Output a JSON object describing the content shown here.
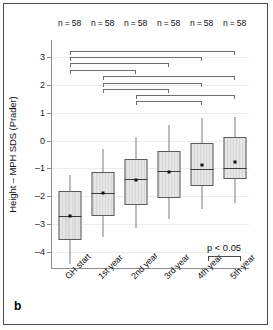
{
  "panel": {
    "letter": "b"
  },
  "chart_data": {
    "type": "box",
    "title": "",
    "xlabel": "",
    "ylabel": "Height – MPH SDS (Prader)",
    "ylim": [
      -4.6,
      3.6
    ],
    "yticks": [
      3,
      2,
      1,
      0,
      -1,
      -2,
      -3,
      -4
    ],
    "ytick_labels": [
      "3",
      "2",
      "1",
      "0",
      "–1",
      "–2",
      "–3",
      "–4"
    ],
    "grid": true,
    "legend": "none",
    "categories": [
      "GH start",
      "1st year",
      "2nd year",
      "3rd year",
      "4th year",
      "5th year"
    ],
    "n_labels": [
      "n = 58",
      "n = 58",
      "n = 58",
      "n = 58",
      "n = 58",
      "n = 58"
    ],
    "boxes": [
      {
        "category": "GH start",
        "whisker_low": -4.43,
        "q1": -3.57,
        "median": -2.7,
        "mean": -2.7,
        "q3": -1.82,
        "whisker_high": -1.23
      },
      {
        "category": "1st year",
        "whisker_low": -3.47,
        "q1": -2.72,
        "median": -1.87,
        "mean": -1.87,
        "q3": -1.11,
        "whisker_high": -0.31
      },
      {
        "category": "2nd year",
        "whisker_low": -3.13,
        "q1": -2.3,
        "median": -1.38,
        "mean": -1.4,
        "q3": -0.65,
        "whisker_high": 0.13
      },
      {
        "category": "3rd year",
        "whisker_low": -2.8,
        "q1": -2.06,
        "median": -1.08,
        "mean": -1.13,
        "q3": -0.36,
        "whisker_high": 0.55
      },
      {
        "category": "4th year",
        "whisker_low": -2.44,
        "q1": -1.63,
        "median": -1.02,
        "mean": -0.88,
        "q3": -0.09,
        "whisker_high": 0.79
      },
      {
        "category": "5th year",
        "whisker_low": -2.22,
        "q1": -1.39,
        "median": -1.0,
        "mean": -0.78,
        "q3": 0.14,
        "whisker_high": 0.85
      }
    ],
    "significance_brackets": [
      {
        "from": "GH start",
        "to": "5th year",
        "level": 3.22
      },
      {
        "from": "GH start",
        "to": "4th year",
        "level": 3.0
      },
      {
        "from": "GH start",
        "to": "3rd year",
        "level": 2.76
      },
      {
        "from": "GH start",
        "to": "2nd year",
        "level": 2.52
      },
      {
        "from": "1st year",
        "to": "5th year",
        "level": 2.3
      },
      {
        "from": "1st year",
        "to": "4th year",
        "level": 2.07
      },
      {
        "from": "1st year",
        "to": "3rd year",
        "level": 1.84
      },
      {
        "from": "2nd year",
        "to": "5th year",
        "level": 1.64
      },
      {
        "from": "2nd year",
        "to": "4th year",
        "level": 1.41
      }
    ],
    "p_annotation": {
      "text": "p < 0.05",
      "from": "4th year",
      "to": "5th year"
    },
    "colors": {
      "box_fill": "#dedede",
      "box_edge": "#5b5b5b",
      "median_line": "#3a3a3a",
      "whisker": "#7c7c7c",
      "grid": "#ececec",
      "axis": "#8d8d8d",
      "text": "#101010",
      "frame": "#4a4a4a"
    }
  }
}
